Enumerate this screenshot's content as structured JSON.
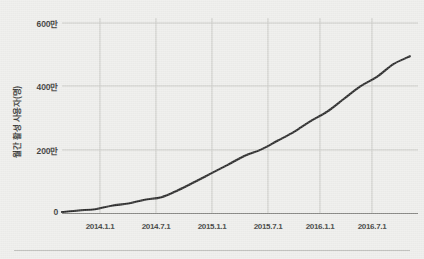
{
  "chart_data": {
    "type": "line",
    "title": "",
    "subtitle": "",
    "xlabel": "",
    "ylabel": "월간 활성 사용자(명)",
    "xtick_labels": [
      "2014.1.1",
      "2014.7.1",
      "2015.1.1",
      "2015.7.1",
      "2016.1.1",
      "2016.7.1"
    ],
    "ytick_labels": [
      "0",
      "200만",
      "400만",
      "600만"
    ],
    "ytick_values": [
      0,
      2000000,
      4000000,
      6000000
    ],
    "ylim": [
      0,
      6000000
    ],
    "xlim": [
      "2013.10.1",
      "2016.12.1"
    ],
    "grid": true,
    "legend": false,
    "legend_position": "none",
    "series": [
      {
        "name": "월간 활성 사용자",
        "color": "#2b2b2b",
        "x": [
          "2013.10.1",
          "2013.12.1",
          "2014.1.1",
          "2014.3.1",
          "2014.4.1",
          "2014.6.1",
          "2014.7.1",
          "2014.9.1",
          "2014.11.1",
          "2015.1.1",
          "2015.3.1",
          "2015.5.1",
          "2015.7.1",
          "2015.9.1",
          "2015.11.1",
          "2016.1.1",
          "2016.3.1",
          "2016.5.1",
          "2016.7.1",
          "2016.9.1",
          "2016.11.1",
          "2016.12.1"
        ],
        "values": [
          30000,
          80000,
          120000,
          230000,
          300000,
          420000,
          500000,
          720000,
          980000,
          1250000,
          1520000,
          1800000,
          2000000,
          2280000,
          2560000,
          2900000,
          3200000,
          3600000,
          4000000,
          4300000,
          4700000,
          4950000
        ]
      }
    ]
  },
  "axes": {
    "y_title": "월간 활성 사용자(명)",
    "y_ticks": [
      {
        "label": "600만",
        "value": 6000000
      },
      {
        "label": "400만",
        "value": 4000000
      },
      {
        "label": "200만",
        "value": 2000000
      },
      {
        "label": "0",
        "value": 0
      }
    ],
    "x_ticks": [
      {
        "label": "2014.1.1"
      },
      {
        "label": "2014.7.1"
      },
      {
        "label": "2015.1.1"
      },
      {
        "label": "2015.7.1"
      },
      {
        "label": "2016.1.1"
      },
      {
        "label": "2016.7.1"
      }
    ]
  },
  "colors": {
    "background": "#eeeeec",
    "line": "#2b2b2b",
    "grid": "#c8c8c4",
    "axis": "#7b7b78",
    "text": "#3a3a38",
    "rule": "#b9b9b6"
  }
}
